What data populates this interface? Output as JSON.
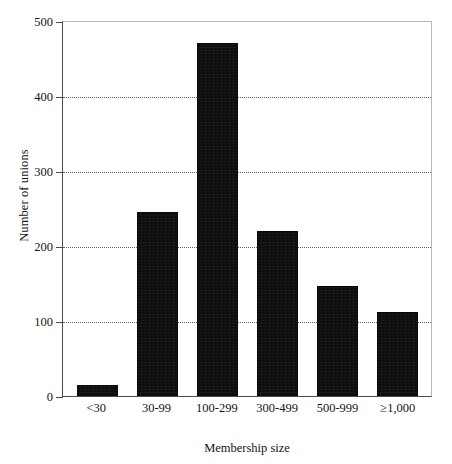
{
  "chart_data": {
    "type": "bar",
    "title": "",
    "xlabel": "Membership size",
    "ylabel": "Number of unions",
    "categories": [
      "<30",
      "30-99",
      "100-299",
      "300-499",
      "500-999",
      "≥1,000"
    ],
    "values": [
      15,
      245,
      470,
      220,
      146,
      112
    ],
    "ylim": [
      0,
      500
    ],
    "yticks": [
      0,
      100,
      200,
      300,
      400,
      500
    ],
    "ytick_labels": [
      "0",
      "100",
      "200",
      "300",
      "400",
      "500"
    ],
    "gridlines": {
      "enabled": true,
      "axis": "y",
      "style": "dotted",
      "at": [
        100,
        200,
        300,
        400
      ]
    },
    "legend": {
      "present": false,
      "position": "none"
    },
    "series": [
      {
        "name": "Number of unions",
        "color": "#0d0d0d",
        "values": [
          15,
          245,
          470,
          220,
          146,
          112
        ]
      }
    ],
    "colors": {
      "bar": "#0d0d0d",
      "axis": "#4a4a4a",
      "frame": "#b9b9b9",
      "grid": "#5f5f5f",
      "text": "#151515",
      "background": "#ffffff"
    }
  }
}
